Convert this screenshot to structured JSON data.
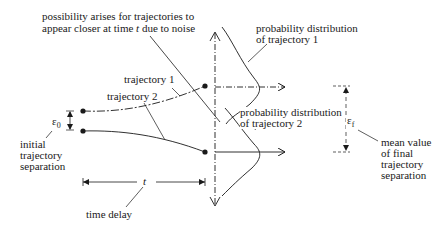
{
  "diagram": {
    "noise_note": {
      "line1": "possibility arises for trajectories to",
      "line2_prefix": "appear closer at time ",
      "line2_var": "t",
      "line2_suffix": " due to noise"
    },
    "trajectory1_label": "trajectory 1",
    "trajectory2_label": "trajectory 2",
    "epsilon0_symbol": "ε",
    "epsilon0_sub": "0",
    "initial_separation": [
      "initial",
      "trajectory",
      "separation"
    ],
    "time_symbol": "t",
    "time_delay_label": "time delay",
    "dist1_label": [
      "probability distribution",
      "of trajectory 1"
    ],
    "dist2_label": [
      "probability distribution",
      "of trajectory 2"
    ],
    "epsilonf_symbol": "ε",
    "epsilonf_sub": "f",
    "final_separation": [
      "mean value",
      "of final",
      "trajectory",
      "separation"
    ],
    "colors": {
      "ink": "#1a1a1a",
      "background": "#ffffff"
    }
  }
}
